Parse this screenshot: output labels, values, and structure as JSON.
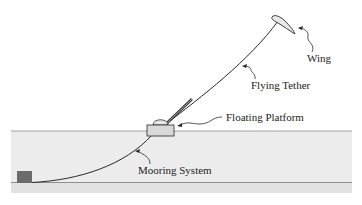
{
  "diagram": {
    "type": "airborne wind energy system schematic",
    "labels": {
      "wing": "Wing",
      "flying_tether": "Flying Tether",
      "floating_platform": "Floating Platform",
      "mooring_system": "Mooring System"
    },
    "colors": {
      "water": "#ececec",
      "seabed_band": "#e2e2e2",
      "line": "#2a2a2a",
      "platform_fill": "#d9d9d9",
      "anchor_fill": "#6b6b6b",
      "wing_fill": "#e8e8e8"
    }
  }
}
